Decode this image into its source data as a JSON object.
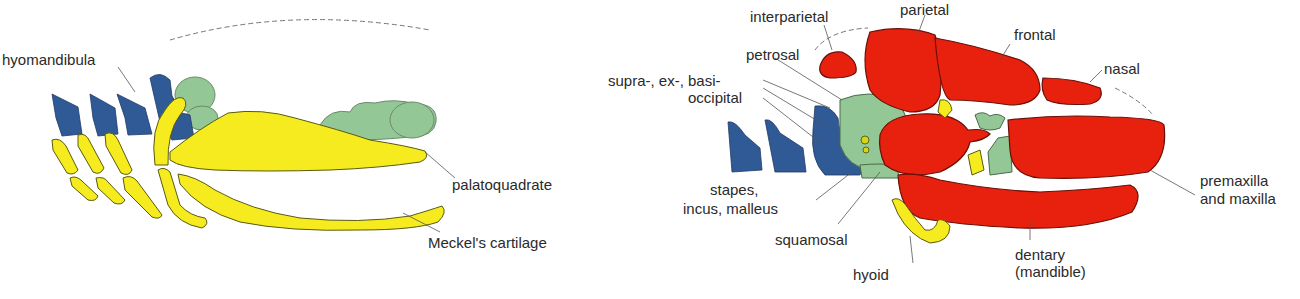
{
  "colors": {
    "cartilage_yellow": "#f5eb1e",
    "bone_red": "#e8200e",
    "neurocranium_green": "#94c796",
    "gill_blue": "#2f5a96",
    "outline": "#3a3a1a",
    "label_text": "#2a2a2a"
  },
  "left_panel": {
    "name": "fish-jaw-skeleton",
    "labels": {
      "hyomandibula": "hyomandibula",
      "palatoquadrate": "palatoquadrate",
      "meckels": "Meckel's cartilage"
    }
  },
  "right_panel": {
    "name": "mammal-skull",
    "labels": {
      "interparietal": "interparietal",
      "parietal": "parietal",
      "frontal": "frontal",
      "nasal": "nasal",
      "petrosal": "petrosal",
      "occipital_line1": "supra-, ex-, basi-",
      "occipital_line2": "occipital",
      "stapes_line1": "stapes,",
      "stapes_line2": "incus, malleus",
      "squamosal": "squamosal",
      "hyoid": "hyoid",
      "dentary_line1": "dentary",
      "dentary_line2": "(mandible)",
      "premaxilla_line1": "premaxilla",
      "premaxilla_line2": "and maxilla"
    }
  }
}
